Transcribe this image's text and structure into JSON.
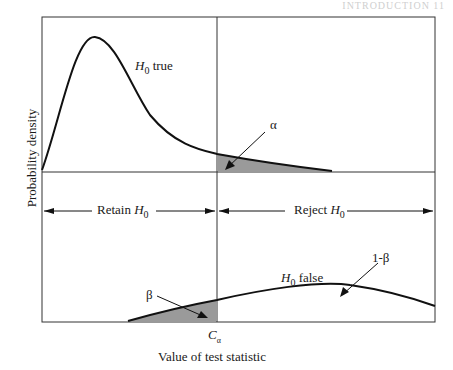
{
  "running_head": "INTRODUCTION 11",
  "diagram": {
    "title": "",
    "y_axis_label": "Probability density",
    "x_axis_label": "Value of test statistic",
    "critical_value_label": "C",
    "critical_value_subscript": "α",
    "curves": [
      {
        "name": "null-distribution",
        "label_main": "H",
        "label_sub": "0",
        "label_rest": " true",
        "tail_area_label": "α"
      },
      {
        "name": "alternative-distribution",
        "label_main": "H",
        "label_sub": "0",
        "label_rest": " false",
        "tail_area_label": "β",
        "power_label": "1-β"
      }
    ],
    "regions": {
      "retain": {
        "text": "Retain ",
        "h": "H",
        "sub": "0"
      },
      "reject": {
        "text": "Reject ",
        "h": "H",
        "sub": "0"
      }
    },
    "colors": {
      "line": "#1a1a1a",
      "shade": "#9a9a9a"
    }
  }
}
